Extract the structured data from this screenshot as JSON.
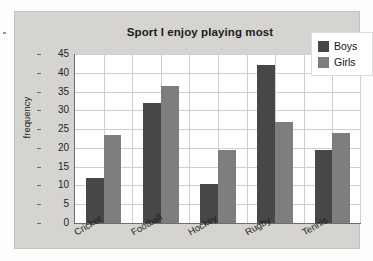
{
  "chart_data": {
    "type": "bar",
    "title": "Sport I enjoy playing most",
    "xlabel": "",
    "ylabel": "frequency",
    "categories": [
      "Cricket",
      "Football",
      "Hockey",
      "Rugby",
      "Tennis"
    ],
    "series": [
      {
        "name": "Boys",
        "color": "#474747",
        "values": [
          12,
          32,
          10.5,
          42,
          19.5
        ]
      },
      {
        "name": "Girls",
        "color": "#7e7e7e",
        "values": [
          23.5,
          36.5,
          19.5,
          27,
          24
        ]
      }
    ],
    "ylim": [
      0,
      45
    ],
    "ytick_step": 5,
    "yticks": [
      0,
      5,
      10,
      15,
      20,
      25,
      30,
      35,
      40,
      45
    ],
    "grid": true,
    "legend_position": "top-right",
    "panel_background": "#d5d4d1",
    "plot_background": "#ffffff",
    "grid_color": "#cfcfcf",
    "axis_color": "#6e6e6e"
  }
}
